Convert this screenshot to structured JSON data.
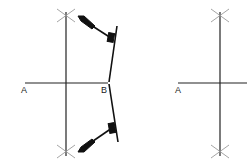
{
  "diagram": {
    "colors": {
      "line": "#222222",
      "arc_mark": "#9a9a9a",
      "compass": "#111111"
    },
    "left_panel": {
      "point_a_label": "A",
      "point_b_label": "B",
      "has_compass": true
    },
    "right_panel": {
      "point_a_label": "A",
      "has_compass": false
    }
  }
}
